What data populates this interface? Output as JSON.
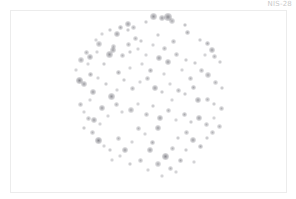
{
  "image": {
    "label": "NIS-28",
    "description": "Circular cloud of blurred grey particles on white background"
  },
  "particles": [
    [
      153,
      16,
      3.5,
      0.55
    ],
    [
      162,
      18,
      3,
      0.5
    ],
    [
      168,
      17,
      4,
      0.6
    ],
    [
      172,
      21,
      3,
      0.45
    ],
    [
      146,
      22,
      2,
      0.35
    ],
    [
      120,
      27,
      2.5,
      0.45
    ],
    [
      128,
      24,
      3,
      0.5
    ],
    [
      133,
      27,
      2.5,
      0.4
    ],
    [
      185,
      25,
      2,
      0.4
    ],
    [
      187,
      32,
      2.5,
      0.45
    ],
    [
      110,
      30,
      2,
      0.35
    ],
    [
      102,
      34,
      2,
      0.3
    ],
    [
      117,
      34,
      3,
      0.5
    ],
    [
      128,
      30,
      2,
      0.35
    ],
    [
      135,
      38,
      2.5,
      0.4
    ],
    [
      96,
      40,
      2,
      0.3
    ],
    [
      99,
      44,
      3,
      0.45
    ],
    [
      113,
      46,
      2.5,
      0.4
    ],
    [
      128,
      44,
      2.5,
      0.4
    ],
    [
      141,
      41,
      2,
      0.35
    ],
    [
      153,
      45,
      2,
      0.3
    ],
    [
      158,
      35,
      2,
      0.35
    ],
    [
      164,
      48,
      2.5,
      0.4
    ],
    [
      173,
      41,
      2.5,
      0.4
    ],
    [
      200,
      40,
      2,
      0.35
    ],
    [
      207,
      43,
      2.5,
      0.45
    ],
    [
      212,
      50,
      3,
      0.5
    ],
    [
      214,
      56,
      2.5,
      0.4
    ],
    [
      220,
      62,
      2,
      0.35
    ],
    [
      205,
      55,
      2,
      0.3
    ],
    [
      86,
      52,
      2.5,
      0.4
    ],
    [
      90,
      57,
      3,
      0.5
    ],
    [
      97,
      52,
      2,
      0.3
    ],
    [
      81,
      60,
      3,
      0.45
    ],
    [
      109,
      54,
      3.5,
      0.55
    ],
    [
      113,
      50,
      3,
      0.5
    ],
    [
      122,
      55,
      2.5,
      0.4
    ],
    [
      130,
      52,
      2,
      0.35
    ],
    [
      138,
      49,
      2,
      0.3
    ],
    [
      146,
      55,
      2,
      0.3
    ],
    [
      159,
      58,
      3,
      0.5
    ],
    [
      168,
      62,
      3,
      0.5
    ],
    [
      176,
      54,
      2.5,
      0.4
    ],
    [
      186,
      60,
      2,
      0.35
    ],
    [
      195,
      63,
      2,
      0.35
    ],
    [
      201,
      70,
      2.5,
      0.4
    ],
    [
      208,
      75,
      3,
      0.45
    ],
    [
      215,
      82,
      2.5,
      0.4
    ],
    [
      222,
      88,
      2,
      0.35
    ],
    [
      76,
      70,
      2,
      0.3
    ],
    [
      79,
      80,
      3.5,
      0.6
    ],
    [
      84,
      84,
      3,
      0.5
    ],
    [
      90,
      74,
      2.5,
      0.45
    ],
    [
      93,
      92,
      3,
      0.5
    ],
    [
      98,
      78,
      2,
      0.3
    ],
    [
      106,
      84,
      2,
      0.35
    ],
    [
      111,
      96,
      3.5,
      0.55
    ],
    [
      117,
      90,
      2,
      0.3
    ],
    [
      124,
      80,
      2,
      0.35
    ],
    [
      132,
      88,
      2.5,
      0.4
    ],
    [
      140,
      82,
      2,
      0.3
    ],
    [
      147,
      78,
      2.5,
      0.4
    ],
    [
      155,
      88,
      3,
      0.5
    ],
    [
      162,
      92,
      2,
      0.35
    ],
    [
      170,
      84,
      2,
      0.3
    ],
    [
      178,
      90,
      2.5,
      0.4
    ],
    [
      185,
      94,
      2,
      0.35
    ],
    [
      193,
      87,
      2.5,
      0.45
    ],
    [
      198,
      100,
      3,
      0.5
    ],
    [
      207,
      99,
      2.5,
      0.4
    ],
    [
      214,
      104,
      2,
      0.35
    ],
    [
      221,
      108,
      2.5,
      0.4
    ],
    [
      80,
      104,
      2.5,
      0.4
    ],
    [
      84,
      112,
      2,
      0.3
    ],
    [
      88,
      118,
      2.5,
      0.4
    ],
    [
      94,
      120,
      3,
      0.5
    ],
    [
      102,
      108,
      3,
      0.5
    ],
    [
      108,
      116,
      2,
      0.3
    ],
    [
      116,
      104,
      2.5,
      0.4
    ],
    [
      122,
      112,
      2,
      0.3
    ],
    [
      131,
      110,
      3,
      0.45
    ],
    [
      138,
      104,
      2,
      0.3
    ],
    [
      146,
      114,
      2.5,
      0.4
    ],
    [
      153,
      106,
      2,
      0.35
    ],
    [
      160,
      118,
      3,
      0.5
    ],
    [
      168,
      110,
      2.5,
      0.4
    ],
    [
      176,
      120,
      2,
      0.3
    ],
    [
      184,
      114,
      2.5,
      0.45
    ],
    [
      191,
      122,
      2,
      0.35
    ],
    [
      199,
      118,
      3,
      0.5
    ],
    [
      206,
      124,
      2.5,
      0.4
    ],
    [
      214,
      118,
      2,
      0.3
    ],
    [
      219,
      126,
      2.5,
      0.4
    ],
    [
      84,
      128,
      2,
      0.35
    ],
    [
      92,
      132,
      2.5,
      0.4
    ],
    [
      98,
      140,
      3.5,
      0.6
    ],
    [
      104,
      146,
      2,
      0.3
    ],
    [
      110,
      150,
      2,
      0.35
    ],
    [
      118,
      138,
      2.5,
      0.4
    ],
    [
      125,
      150,
      3,
      0.5
    ],
    [
      132,
      142,
      2,
      0.3
    ],
    [
      138,
      128,
      2.5,
      0.4
    ],
    [
      145,
      134,
      2,
      0.3
    ],
    [
      152,
      142,
      2.5,
      0.45
    ],
    [
      158,
      128,
      3,
      0.5
    ],
    [
      165,
      156,
      3.5,
      0.6
    ],
    [
      172,
      148,
      2.5,
      0.4
    ],
    [
      178,
      138,
      2,
      0.35
    ],
    [
      186,
      132,
      2.5,
      0.4
    ],
    [
      193,
      140,
      3,
      0.5
    ],
    [
      200,
      146,
      2.5,
      0.45
    ],
    [
      207,
      138,
      2,
      0.35
    ],
    [
      212,
      132,
      2.5,
      0.4
    ],
    [
      150,
      150,
      3,
      0.5
    ],
    [
      158,
      164,
      3,
      0.45
    ],
    [
      170,
      168,
      2.5,
      0.4
    ],
    [
      180,
      160,
      2.5,
      0.45
    ],
    [
      186,
      150,
      2,
      0.35
    ],
    [
      194,
      162,
      2,
      0.3
    ],
    [
      140,
      160,
      2.5,
      0.4
    ],
    [
      130,
      164,
      2,
      0.35
    ],
    [
      120,
      156,
      2,
      0.3
    ],
    [
      112,
      160,
      2,
      0.3
    ],
    [
      148,
      170,
      2,
      0.3
    ],
    [
      162,
      176,
      2,
      0.3
    ],
    [
      176,
      172,
      2,
      0.3
    ],
    [
      100,
      124,
      2,
      0.3
    ],
    [
      90,
      100,
      2,
      0.3
    ],
    [
      88,
      64,
      2,
      0.3
    ],
    [
      104,
      64,
      2,
      0.35
    ],
    [
      142,
      64,
      2,
      0.3
    ],
    [
      150,
      70,
      2.5,
      0.45
    ],
    [
      182,
      70,
      2,
      0.3
    ],
    [
      190,
      78,
      2.5,
      0.4
    ],
    [
      130,
      68,
      2,
      0.3
    ],
    [
      118,
      72,
      2.5,
      0.45
    ],
    [
      164,
      74,
      2,
      0.3
    ],
    [
      172,
      100,
      2,
      0.3
    ]
  ]
}
